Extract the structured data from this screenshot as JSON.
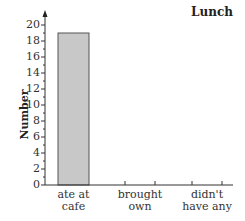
{
  "chart_data": {
    "type": "bar",
    "title": "Lunch",
    "xlabel": "",
    "ylabel": "Number",
    "categories": [
      "ate at cafe",
      "brought own",
      "didn't have any"
    ],
    "category_lines": [
      [
        "ate at",
        "cafe"
      ],
      [
        "brought",
        "own"
      ],
      [
        "didn't",
        "have any"
      ]
    ],
    "values": [
      19,
      null,
      null
    ],
    "ylim": [
      0,
      20
    ],
    "yticks": [
      0,
      2,
      4,
      6,
      8,
      10,
      12,
      14,
      16,
      18,
      20
    ],
    "grid": false,
    "legend": null,
    "bar_color": "#c8c8c8",
    "bar_edge_color": "#555555"
  }
}
